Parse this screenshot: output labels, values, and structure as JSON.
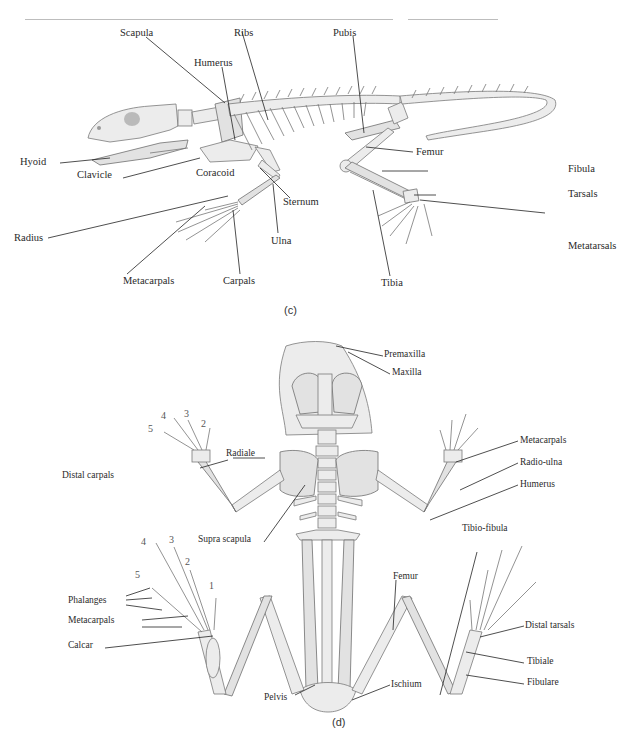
{
  "header_rules": [
    {
      "x1": 25,
      "x2": 393
    },
    {
      "x1": 408,
      "x2": 498
    }
  ],
  "panel_c": {
    "caption": "(c)",
    "labels": {
      "scapula": "Scapula",
      "ribs": "Ribs",
      "pubis": "Pubis",
      "humerus": "Humerus",
      "hyoid": "Hyoid",
      "clavicle": "Clavicle",
      "coracoid": "Coracoid",
      "sternum": "Sternum",
      "femur": "Femur",
      "fibula": "Fibula",
      "tarsals": "Tarsals",
      "radius": "Radius",
      "ulna": "Ulna",
      "metacarpals": "Metacarpals",
      "carpals": "Carpals",
      "tibia": "Tibia",
      "metatarsals": "Metatarsals"
    }
  },
  "panel_d": {
    "caption": "(d)",
    "labels": {
      "premaxilla": "Premaxilla",
      "maxilla": "Maxilla",
      "radiale": "Radiale",
      "distal_carpals": "Distal carpals",
      "metacarpals": "Metacarpals",
      "radio_ulna": "Radio-ulna",
      "humerus": "Humerus",
      "supra_scapula": "Supra scapula",
      "tibio_fibula": "Tibio-fibula",
      "phalanges": "Phalanges",
      "metacarpals_hind": "Metacarpals",
      "calcar": "Calcar",
      "femur": "Femur",
      "distal_tarsals": "Distal tarsals",
      "tibiale": "Tibiale",
      "fibulare": "Fibulare",
      "pelvis": "Pelvis",
      "ischium": "Ischium"
    },
    "fore_digits": [
      "5",
      "4",
      "3",
      "2"
    ],
    "hind_digits": [
      "5",
      "4",
      "3",
      "2",
      "1"
    ]
  }
}
